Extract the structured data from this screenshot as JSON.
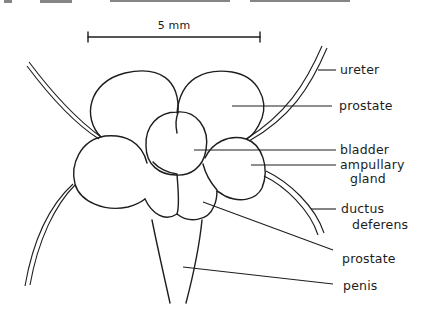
{
  "figure": {
    "scale_bar": {
      "label": "5 mm"
    },
    "labels": {
      "ureter": "ureter",
      "prostate_upper": "prostate",
      "bladder": "bladder",
      "ampullary_line1": "ampullary",
      "ampullary_line2": "gland",
      "ductus_line1": "ductus",
      "ductus_line2": "deferens",
      "prostate_lower": "prostate",
      "penis": "penis"
    }
  },
  "colors": {
    "ink": "#1e1e1e",
    "background": "#ffffff"
  }
}
